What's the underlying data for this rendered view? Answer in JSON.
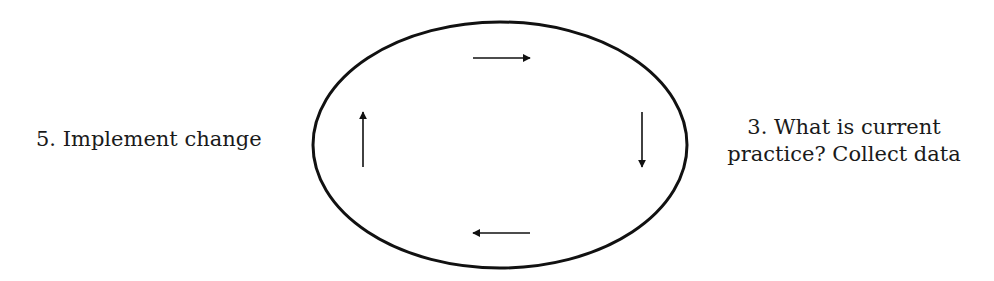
{
  "diagram": {
    "type": "cycle",
    "labels": {
      "left": "5. Implement change",
      "right_line1": "3. What is current",
      "right_line2": "practice? Collect data"
    },
    "ellipse": {
      "cx": 500,
      "cy": 145,
      "rx": 187,
      "ry": 123,
      "stroke": "#111111"
    },
    "arrows": [
      {
        "direction": "right",
        "position": "top"
      },
      {
        "direction": "down",
        "position": "right"
      },
      {
        "direction": "left",
        "position": "bottom"
      },
      {
        "direction": "up",
        "position": "left"
      }
    ]
  }
}
